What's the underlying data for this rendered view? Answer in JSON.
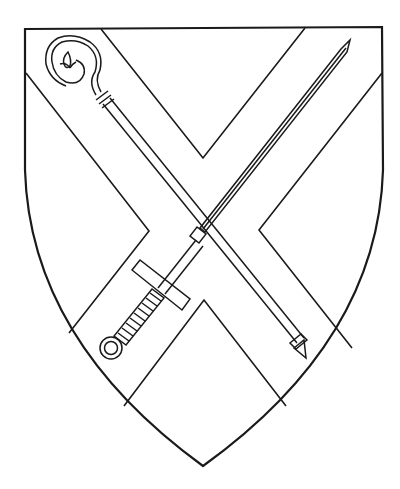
{
  "image": {
    "subject": "Heraldic shield: saltire with crozier and sword in saltire",
    "background": "#ffffff",
    "line_color": "#1a1a1a"
  },
  "charges": [
    "shield-outline",
    "saltire",
    "crozier",
    "sword"
  ]
}
